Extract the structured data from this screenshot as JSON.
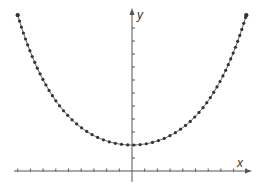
{
  "chart_data": {
    "type": "scatter",
    "title": "",
    "xlabel": "x",
    "ylabel": "y",
    "xlim": [
      -9,
      9
    ],
    "ylim": [
      -1,
      12.5
    ],
    "x_ticks": [
      -9,
      -8,
      -7,
      -6,
      -5,
      -4,
      -3,
      -2,
      -1,
      1,
      2,
      3,
      4,
      5,
      6,
      7,
      8,
      9
    ],
    "y_ticks": [
      1,
      2,
      3,
      4,
      5,
      6,
      7,
      8,
      9,
      10,
      11
    ],
    "tick_labels_shown": false,
    "grid": false,
    "legend": null,
    "series": [
      {
        "name": "curve",
        "color": "#333333",
        "x": [
          -9,
          -8.5,
          -8,
          -7.5,
          -7,
          -6.5,
          -6,
          -5.5,
          -5,
          -4.5,
          -4,
          -3.5,
          -3,
          -2.5,
          -2,
          -1.5,
          -1,
          -0.5,
          0,
          0.5,
          1,
          1.5,
          2,
          2.5,
          3,
          3.5,
          4,
          4.5,
          5,
          5.5,
          6,
          6.5,
          7,
          7.5,
          8,
          8.5,
          9
        ],
        "y": [
          12.0,
          10.48,
          9.15,
          8.01,
          7.01,
          6.15,
          5.41,
          4.76,
          4.21,
          3.74,
          3.34,
          3.0,
          2.72,
          2.49,
          2.31,
          2.17,
          2.08,
          2.02,
          2.0,
          2.02,
          2.08,
          2.17,
          2.31,
          2.49,
          2.72,
          3.0,
          3.34,
          3.74,
          4.21,
          4.76,
          5.41,
          6.15,
          7.01,
          8.01,
          9.15,
          10.48,
          12.0
        ]
      }
    ],
    "curve_params": {
      "a": 2,
      "b": 3.633
    }
  },
  "axes": {
    "x_label": "x",
    "y_label": "y",
    "color": "#555555"
  }
}
